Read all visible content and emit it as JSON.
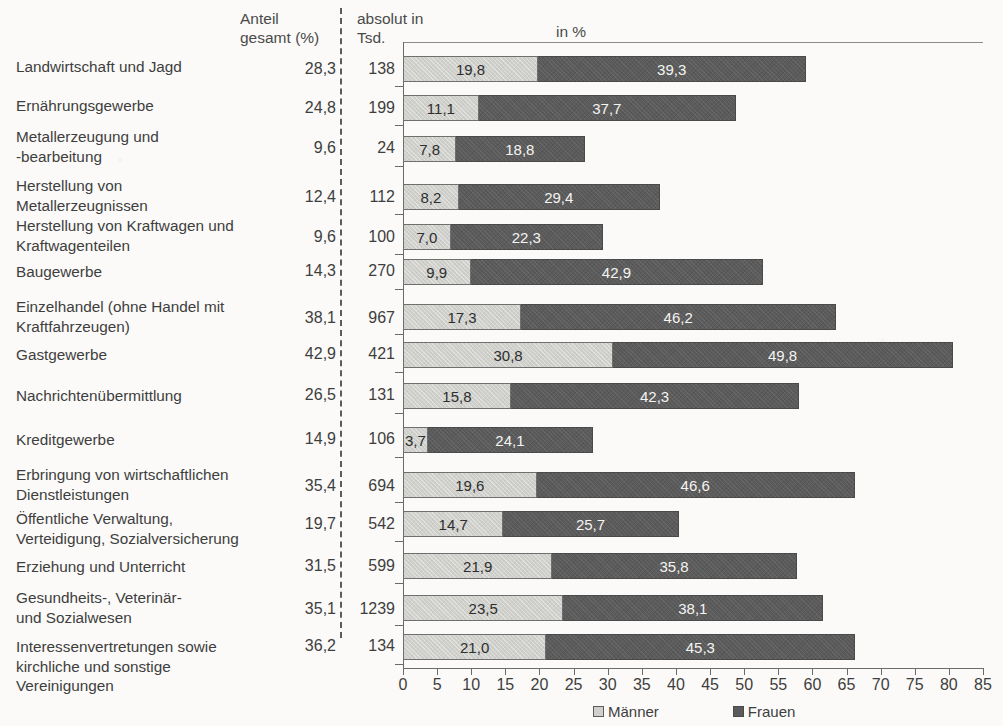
{
  "header": {
    "col_category": "",
    "col_share_total": "Anteil\ngesamt (%)",
    "col_absolute": "absolut in\nTsd.",
    "col_percent": "in %"
  },
  "legend": {
    "men_label": "Männer",
    "women_label": "Frauen",
    "men_color": "#cfcfcb",
    "women_color": "#5b5b5b"
  },
  "axis": {
    "ticks": [
      "0",
      "5",
      "10",
      "15",
      "20",
      "25",
      "30",
      "35",
      "40",
      "45",
      "50",
      "55",
      "60",
      "65",
      "70",
      "75",
      "80",
      "85"
    ],
    "min": 0,
    "max": 85,
    "step": 5
  },
  "chart_data": {
    "type": "bar",
    "title": "",
    "subtitle": "",
    "orientation": "horizontal",
    "stacked": true,
    "xlabel": "in %",
    "ylabel": "",
    "xlim": [
      0,
      85
    ],
    "grid": false,
    "legend_position": "bottom",
    "categories": [
      "Landwirtschaft und Jagd",
      "Ernährungsgewerbe",
      "Metallerzeugung und\n-bearbeitung",
      "Herstellung von\nMetallerzeugnissen",
      "Herstellung von Kraftwagen und\nKraftwagenteilen",
      "Baugewerbe",
      "Einzelhandel (ohne Handel mit\nKraftfahrzeugen)",
      "Gastgewerbe",
      "Nachrichtenübermittlung",
      "Kreditgewerbe",
      "Erbringung von wirtschaftlichen\nDienstleistungen",
      "Öffentliche Verwaltung,\nVerteidigung, Sozialversicherung",
      "Erziehung und Unterricht",
      "Gesundheits-, Veterinär-\nund Sozialwesen",
      "Interessenvertretungen sowie\nkirchliche und sonstige\nVereinigungen"
    ],
    "series": [
      {
        "name": "Männer",
        "values": [
          19.8,
          11.1,
          7.8,
          8.2,
          7.0,
          9.9,
          17.3,
          30.8,
          15.8,
          3.7,
          19.6,
          14.7,
          21.9,
          23.5,
          21.0
        ],
        "labels": [
          "19,8",
          "11,1",
          "7,8",
          "8,2",
          "7,0",
          "9,9",
          "17,3",
          "30,8",
          "15,8",
          "3,7",
          "19,6",
          "14,7",
          "21,9",
          "23,5",
          "21,0"
        ]
      },
      {
        "name": "Frauen",
        "values": [
          39.3,
          37.7,
          18.8,
          29.4,
          22.3,
          42.9,
          46.2,
          49.8,
          42.3,
          24.1,
          46.6,
          25.7,
          35.8,
          38.1,
          45.3
        ],
        "labels": [
          "39,3",
          "37,7",
          "18,8",
          "29,4",
          "22,3",
          "42,9",
          "46,2",
          "49,8",
          "42,3",
          "24,1",
          "46,6",
          "25,7",
          "35,8",
          "38,1",
          "45,3"
        ]
      }
    ],
    "share_total_pct": [
      "28,3",
      "24,8",
      "9,6",
      "12,4",
      "9,6",
      "14,3",
      "38,1",
      "42,9",
      "26,5",
      "14,9",
      "35,4",
      "19,7",
      "31,5",
      "35,1",
      "36,2"
    ],
    "absolute_thousands": [
      "138",
      "199",
      "24",
      "112",
      "100",
      "270",
      "967",
      "421",
      "131",
      "106",
      "694",
      "542",
      "599",
      "1239",
      "134"
    ]
  },
  "rows": [
    {
      "cat_top": 57,
      "num_top": 60,
      "bar_top": 56,
      "cat_lines": 1
    },
    {
      "cat_top": 96,
      "num_top": 99,
      "bar_top": 95,
      "cat_lines": 1
    },
    {
      "cat_top": 127,
      "num_top": 139,
      "bar_top": 136,
      "cat_lines": 2
    },
    {
      "cat_top": 176,
      "num_top": 188,
      "bar_top": 184,
      "cat_lines": 2
    },
    {
      "cat_top": 216,
      "num_top": 228,
      "bar_top": 224,
      "cat_lines": 2
    },
    {
      "cat_top": 262,
      "num_top": 262,
      "bar_top": 259,
      "cat_lines": 1
    },
    {
      "cat_top": 297,
      "num_top": 309,
      "bar_top": 304,
      "cat_lines": 2
    },
    {
      "cat_top": 345,
      "num_top": 345,
      "bar_top": 342,
      "cat_lines": 1
    },
    {
      "cat_top": 386,
      "num_top": 386,
      "bar_top": 383,
      "cat_lines": 1
    },
    {
      "cat_top": 430,
      "num_top": 430,
      "bar_top": 427,
      "cat_lines": 1
    },
    {
      "cat_top": 465,
      "num_top": 477,
      "bar_top": 472,
      "cat_lines": 2
    },
    {
      "cat_top": 509,
      "num_top": 515,
      "bar_top": 511,
      "cat_lines": 2
    },
    {
      "cat_top": 557,
      "num_top": 557,
      "bar_top": 553,
      "cat_lines": 1
    },
    {
      "cat_top": 588,
      "num_top": 600,
      "bar_top": 595,
      "cat_lines": 2
    },
    {
      "cat_top": 637,
      "num_top": 637,
      "bar_top": 634,
      "cat_lines": 3
    }
  ]
}
